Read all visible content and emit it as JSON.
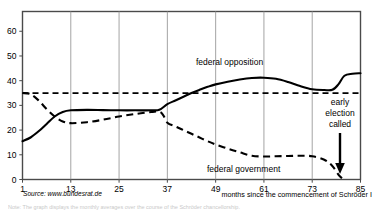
{
  "chart_data": {
    "type": "line",
    "title": "",
    "xlabel": "months since the commencement of Schröder I",
    "ylabel": "",
    "xlim": [
      1,
      85
    ],
    "ylim": [
      0,
      68
    ],
    "xticks": [
      1,
      13,
      25,
      37,
      49,
      61,
      73,
      85
    ],
    "yticks": [
      0,
      10,
      20,
      30,
      40,
      50,
      60
    ],
    "grid": "vertical gridlines at each x tick",
    "legend": "inline labels placed next to each curve",
    "series": [
      {
        "name": "federal opposition",
        "style": "solid",
        "color": "#000000",
        "points": [
          [
            1,
            15.5
          ],
          [
            3,
            17.0
          ],
          [
            5,
            19.5
          ],
          [
            7,
            22.5
          ],
          [
            9,
            25.5
          ],
          [
            11,
            27.3
          ],
          [
            13,
            28.0
          ],
          [
            17,
            28.2
          ],
          [
            21,
            28.1
          ],
          [
            25,
            28.0
          ],
          [
            29,
            28.0
          ],
          [
            33,
            28.0
          ],
          [
            35,
            28.2
          ],
          [
            37,
            30.5
          ],
          [
            39,
            32.0
          ],
          [
            41,
            33.5
          ],
          [
            43,
            35.0
          ],
          [
            45,
            36.3
          ],
          [
            47,
            37.5
          ],
          [
            49,
            38.5
          ],
          [
            52,
            39.6
          ],
          [
            55,
            40.5
          ],
          [
            58,
            41.1
          ],
          [
            61,
            41.2
          ],
          [
            64,
            40.8
          ],
          [
            67,
            39.5
          ],
          [
            70,
            37.8
          ],
          [
            73,
            36.5
          ],
          [
            76,
            36.2
          ],
          [
            78,
            36.3
          ],
          [
            79.5,
            38.5
          ],
          [
            81,
            42.0
          ],
          [
            83,
            42.8
          ],
          [
            85,
            43.0
          ]
        ]
      },
      {
        "name": "federal government",
        "style": "dashed",
        "color": "#000000",
        "points": [
          [
            1,
            35.0
          ],
          [
            3,
            34.5
          ],
          [
            5,
            32.0
          ],
          [
            7,
            28.5
          ],
          [
            9,
            25.5
          ],
          [
            11,
            23.5
          ],
          [
            13,
            22.8
          ],
          [
            17,
            23.2
          ],
          [
            21,
            24.2
          ],
          [
            25,
            25.5
          ],
          [
            29,
            26.5
          ],
          [
            33,
            27.3
          ],
          [
            35,
            27.5
          ],
          [
            36,
            26.0
          ],
          [
            37,
            23.0
          ],
          [
            39,
            21.5
          ],
          [
            41,
            20.0
          ],
          [
            43,
            18.5
          ],
          [
            45,
            17.0
          ],
          [
            47,
            15.5
          ],
          [
            49,
            14.2
          ],
          [
            52,
            12.5
          ],
          [
            55,
            11.0
          ],
          [
            58,
            9.6
          ],
          [
            61,
            9.3
          ],
          [
            64,
            9.4
          ],
          [
            67,
            9.5
          ],
          [
            70,
            9.6
          ],
          [
            73,
            9.4
          ],
          [
            76,
            8.0
          ],
          [
            78,
            5.5
          ],
          [
            79.5,
            2.0
          ],
          [
            80.5,
            0.3
          ]
        ]
      },
      {
        "name": "reference level",
        "style": "dashed",
        "color": "#000000",
        "points": [
          [
            1,
            35.0
          ],
          [
            85,
            35.0
          ]
        ]
      }
    ],
    "annotations": [
      {
        "name": "early-election-called",
        "lines": [
          "early",
          "election",
          "called"
        ],
        "arrow": "down",
        "at_x": 80
      },
      {
        "name": "series-label-opposition",
        "text": "federal opposition"
      },
      {
        "name": "series-label-government",
        "text": "federal government"
      }
    ],
    "source": "Source: www.bundesrat.de"
  },
  "axis": {
    "ytick_labels": [
      "60",
      "50",
      "40",
      "30",
      "20",
      "10",
      "0"
    ],
    "xtick_labels": [
      "1",
      "13",
      "25",
      "37",
      "49",
      "61",
      "73",
      "85"
    ],
    "x_caption": "months since the commencement of Schröder I"
  },
  "labels": {
    "opposition": "federal opposition",
    "government": "federal government",
    "anno_line1": "early",
    "anno_line2": "election",
    "anno_line3": "called",
    "source": "Source: www.bundesrat.de"
  },
  "colors": {
    "line": "#000000",
    "grid": "#9a9a9a",
    "frame": "#4a4a4a",
    "background": "#ffffff"
  },
  "tail": {
    "partial_text": "Note: The graph displays the monthly averages over the course of the Schröder chancellorship."
  }
}
